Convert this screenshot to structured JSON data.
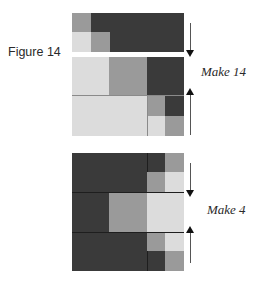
{
  "figure": {
    "title": "Figure 14"
  },
  "units": [
    {
      "id": "top",
      "label": "Make 14"
    },
    {
      "id": "bottom",
      "label": "Make 4"
    }
  ],
  "colors": {
    "dark": "#3a3a3a",
    "medium": "#9a9a9a",
    "light": "#dcdcdc"
  }
}
